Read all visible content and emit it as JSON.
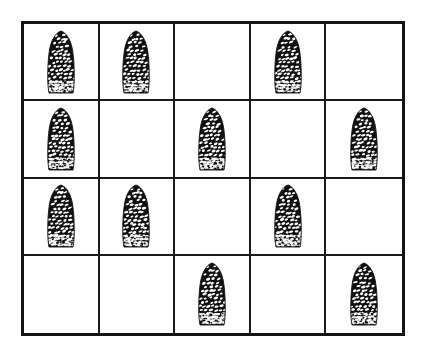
{
  "figure": {
    "title": "",
    "background_color": "#ffffff",
    "border_color": "#141414",
    "divider_color": "#1a1a1a",
    "object_color": "#101010",
    "object_highlight_color": "#ffffff"
  },
  "grid": {
    "columns": 5,
    "rows": 4,
    "total_cells": 20,
    "filled_cells": 12,
    "empty_cells": 8,
    "object_name": "pinecone",
    "cells": [
      {
        "row": 1,
        "col": 1,
        "filled": true,
        "label": "pinecone"
      },
      {
        "row": 1,
        "col": 2,
        "filled": true,
        "label": "pinecone"
      },
      {
        "row": 1,
        "col": 3,
        "filled": false,
        "label": ""
      },
      {
        "row": 1,
        "col": 4,
        "filled": true,
        "label": "pinecone"
      },
      {
        "row": 1,
        "col": 5,
        "filled": false,
        "label": ""
      },
      {
        "row": 2,
        "col": 1,
        "filled": true,
        "label": "pinecone"
      },
      {
        "row": 2,
        "col": 2,
        "filled": false,
        "label": ""
      },
      {
        "row": 2,
        "col": 3,
        "filled": true,
        "label": "pinecone"
      },
      {
        "row": 2,
        "col": 4,
        "filled": false,
        "label": ""
      },
      {
        "row": 2,
        "col": 5,
        "filled": true,
        "label": "pinecone"
      },
      {
        "row": 3,
        "col": 1,
        "filled": true,
        "label": "pinecone"
      },
      {
        "row": 3,
        "col": 2,
        "filled": true,
        "label": "pinecone"
      },
      {
        "row": 3,
        "col": 3,
        "filled": false,
        "label": ""
      },
      {
        "row": 3,
        "col": 4,
        "filled": true,
        "label": "pinecone"
      },
      {
        "row": 3,
        "col": 5,
        "filled": false,
        "label": ""
      },
      {
        "row": 4,
        "col": 1,
        "filled": false,
        "label": ""
      },
      {
        "row": 4,
        "col": 2,
        "filled": false,
        "label": ""
      },
      {
        "row": 4,
        "col": 3,
        "filled": true,
        "label": "pinecone"
      },
      {
        "row": 4,
        "col": 4,
        "filled": false,
        "label": ""
      },
      {
        "row": 4,
        "col": 5,
        "filled": true,
        "label": "pinecone"
      }
    ]
  }
}
